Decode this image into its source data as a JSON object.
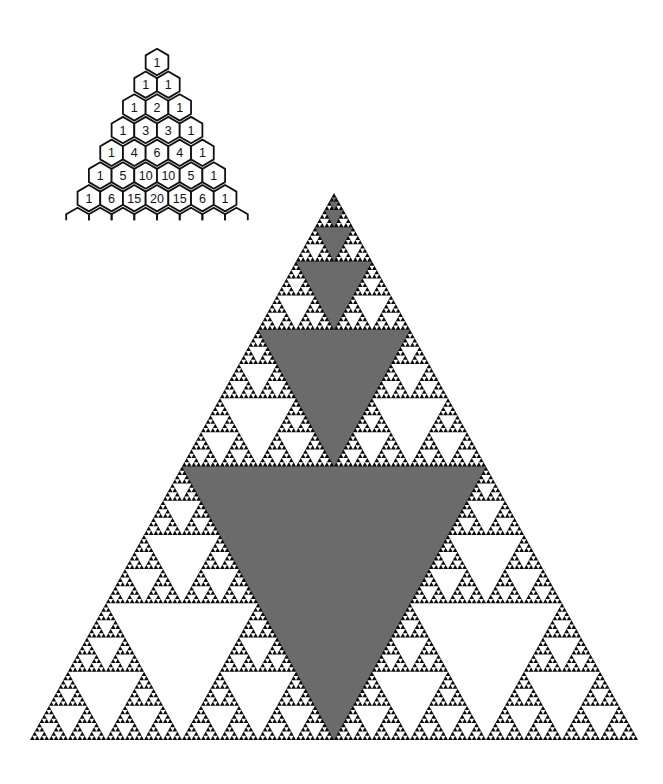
{
  "pascal_triangle": {
    "title": "Pascal's triangle",
    "rows": [
      [
        1
      ],
      [
        1,
        1
      ],
      [
        1,
        2,
        1
      ],
      [
        1,
        3,
        3,
        1
      ],
      [
        1,
        4,
        6,
        4,
        1
      ],
      [
        1,
        5,
        10,
        10,
        5,
        1
      ],
      [
        1,
        6,
        15,
        20,
        15,
        6,
        1
      ]
    ],
    "apex_center": [
      157,
      62
    ],
    "cell_spacing": 22.7,
    "row_spacing": 22.7,
    "hex_radius": 13.2,
    "continues_below": true
  },
  "sierpinski_triangle": {
    "title": "Sierpinski triangle",
    "apex": [
      334,
      193
    ],
    "base_left": [
      30,
      740
    ],
    "base_right": [
      638,
      740
    ],
    "depth": 7,
    "colors": {
      "fill": "#0a0a0a",
      "hole": "#ffffff",
      "center_hole": "#6b6b6b"
    },
    "center_holes_highlighted": true
  },
  "colors": {
    "background": "#ffffff",
    "line": "#111111"
  }
}
